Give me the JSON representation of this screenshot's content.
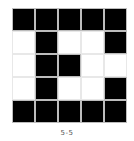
{
  "puzzle": {
    "rows": 5,
    "cols": 5,
    "filled_color": "#000000",
    "empty_color": "#ffffff",
    "cells": [
      [
        1,
        1,
        1,
        1,
        1
      ],
      [
        0,
        1,
        0,
        0,
        1
      ],
      [
        0,
        1,
        1,
        0,
        0
      ],
      [
        0,
        1,
        0,
        0,
        1
      ],
      [
        1,
        1,
        1,
        1,
        1
      ]
    ],
    "label": "5-5"
  }
}
